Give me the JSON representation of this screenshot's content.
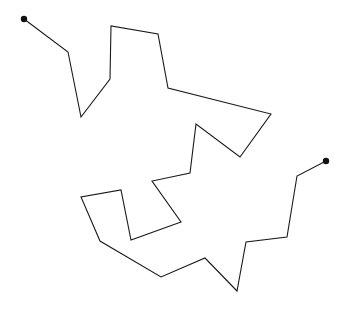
{
  "figure": {
    "type": "polyline-path",
    "title": "",
    "background_color": "#ffffff",
    "stroke_color": "#1a1a1a",
    "stroke_width": 1.1,
    "endpoint_color": "#111111",
    "endpoint_radius": 3.2,
    "canvas": {
      "width": 354,
      "height": 311
    },
    "start_point": {
      "x": 24,
      "y": 19,
      "label": "start"
    },
    "end_point": {
      "x": 326,
      "y": 161,
      "label": "end"
    },
    "vertices": [
      {
        "x": 24,
        "y": 19
      },
      {
        "x": 68,
        "y": 52
      },
      {
        "x": 81,
        "y": 117
      },
      {
        "x": 110,
        "y": 79
      },
      {
        "x": 111,
        "y": 26
      },
      {
        "x": 158,
        "y": 34
      },
      {
        "x": 168,
        "y": 88
      },
      {
        "x": 271,
        "y": 114
      },
      {
        "x": 240,
        "y": 157
      },
      {
        "x": 196,
        "y": 124
      },
      {
        "x": 190,
        "y": 173
      },
      {
        "x": 152,
        "y": 181
      },
      {
        "x": 181,
        "y": 222
      },
      {
        "x": 131,
        "y": 240
      },
      {
        "x": 121,
        "y": 190
      },
      {
        "x": 81,
        "y": 197
      },
      {
        "x": 100,
        "y": 241
      },
      {
        "x": 161,
        "y": 277
      },
      {
        "x": 205,
        "y": 258
      },
      {
        "x": 237,
        "y": 291
      },
      {
        "x": 246,
        "y": 242
      },
      {
        "x": 287,
        "y": 237
      },
      {
        "x": 297,
        "y": 176
      },
      {
        "x": 326,
        "y": 161
      }
    ],
    "path_d": "M 24 19 L 68 52 L 81 117 L 110 79 L 111 26 L 158 34 L 168 88 L 271 114 L 240 157 L 196 124 L 190 173 L 152 181 L 181 222 L 131 240 L 121 190 L 81 197 L 100 241 L 161 277 L 205 258 L 237 291 L 246 242 L 287 237 L 297 176 L 326 161"
  }
}
